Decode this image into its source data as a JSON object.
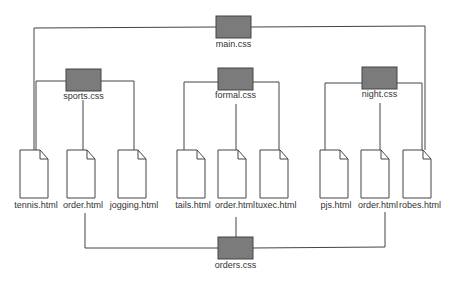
{
  "diagram": {
    "type": "stylesheet-dependency-tree",
    "colors": {
      "css_box_fill": "#7b7b7b",
      "line": "#444444",
      "page_fill": "#ffffff",
      "text": "#333333"
    },
    "main_css": {
      "label": "main.css"
    },
    "section_css": [
      {
        "label": "sports.css"
      },
      {
        "label": "formal.css"
      },
      {
        "label": "night.css"
      }
    ],
    "pages": [
      {
        "label": "tennis.html",
        "group": "sports.css"
      },
      {
        "label": "order.html",
        "group": "sports.css"
      },
      {
        "label": "jogging.html",
        "group": "sports.css"
      },
      {
        "label": "tails.html",
        "group": "formal.css"
      },
      {
        "label": "order.html",
        "group": "formal.css"
      },
      {
        "label": "tuxec.html",
        "group": "formal.css"
      },
      {
        "label": "pjs.html",
        "group": "night.css"
      },
      {
        "label": "order.html",
        "group": "night.css"
      },
      {
        "label": "robes.html",
        "group": "night.css"
      }
    ],
    "orders_css": {
      "label": "orders.css"
    },
    "edges": [
      [
        "main.css",
        "tennis.html"
      ],
      [
        "main.css",
        "robes.html"
      ],
      [
        "sports.css",
        "tennis.html"
      ],
      [
        "sports.css",
        "order.html"
      ],
      [
        "sports.css",
        "jogging.html"
      ],
      [
        "formal.css",
        "tails.html"
      ],
      [
        "formal.css",
        "order.html"
      ],
      [
        "formal.css",
        "tuxec.html"
      ],
      [
        "night.css",
        "pjs.html"
      ],
      [
        "night.css",
        "order.html"
      ],
      [
        "night.css",
        "robes.html"
      ],
      [
        "orders.css",
        "order.html (sports)"
      ],
      [
        "orders.css",
        "order.html (formal)"
      ],
      [
        "orders.css",
        "order.html (night)"
      ]
    ]
  }
}
